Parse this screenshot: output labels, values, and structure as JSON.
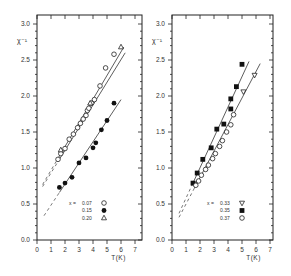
{
  "chart_data": [
    {
      "type": "scatter",
      "panel": "left",
      "title": "",
      "xlabel": "T(K)",
      "ylabel": "χ⁻¹",
      "xlim": [
        0,
        7.5
      ],
      "ylim": [
        0,
        3.0
      ],
      "xticks": [
        0,
        1,
        2,
        3,
        4,
        5,
        6,
        7
      ],
      "xtick_labels": [
        "0",
        "1",
        "2",
        "3",
        "4",
        "5",
        "6",
        "7"
      ],
      "yticks": [
        0.0,
        0.5,
        1.0,
        1.5,
        2.0,
        2.5,
        3.0
      ],
      "ytick_labels": [
        "0.0",
        "0.5",
        "1.0",
        "1.5",
        "2.0",
        "2.5",
        "3.0"
      ],
      "legend_position": "bottom-right",
      "legend_prefix": "x =",
      "series": [
        {
          "name": "0.07",
          "marker": "open-circle",
          "x": [
            1.5,
            1.7,
            2.0,
            2.3,
            2.6,
            2.9,
            3.1,
            3.3,
            3.5,
            3.6,
            3.7,
            3.9,
            4.1,
            4.5,
            4.9,
            5.5
          ],
          "y": [
            1.12,
            1.2,
            1.27,
            1.4,
            1.47,
            1.56,
            1.62,
            1.68,
            1.73,
            1.8,
            1.83,
            1.9,
            1.95,
            2.14,
            2.39,
            2.58
          ]
        },
        {
          "name": "0.15",
          "marker": "filled-circle",
          "x": [
            1.6,
            2.0,
            2.5,
            3.0,
            3.5,
            4.0,
            4.2,
            4.6,
            5.0,
            5.5
          ],
          "y": [
            0.73,
            0.79,
            0.87,
            1.07,
            1.14,
            1.28,
            1.35,
            1.53,
            1.66,
            1.9
          ]
        },
        {
          "name": "0.20",
          "marker": "open-triangle",
          "x": [
            1.7,
            3.8,
            6.0
          ],
          "y": [
            1.25,
            1.9,
            2.68
          ]
        }
      ],
      "fit_lines": [
        {
          "name": "fit-0.07",
          "x": [
            1.4,
            6.2
          ],
          "y": [
            1.1,
            2.68
          ],
          "extrapolated_x": [
            0.4,
            1.4
          ]
        },
        {
          "name": "fit-0.20",
          "x": [
            1.6,
            6.3
          ],
          "y": [
            1.12,
            2.6
          ],
          "extrapolated_x": [
            0.4,
            1.6
          ]
        },
        {
          "name": "fit-0.15",
          "x": [
            1.6,
            6.0
          ],
          "y": [
            0.66,
            1.95
          ],
          "extrapolated_x": [
            0.5,
            1.6
          ]
        }
      ]
    },
    {
      "type": "scatter",
      "panel": "right",
      "title": "",
      "xlabel": "T(K)",
      "ylabel": "χ⁻¹",
      "xlim": [
        0,
        7.5
      ],
      "ylim": [
        0,
        3.0
      ],
      "xticks": [
        0,
        1,
        2,
        3,
        4,
        5,
        6,
        7
      ],
      "xtick_labels": [
        "0",
        "1",
        "2",
        "3",
        "4",
        "5",
        "6",
        "7"
      ],
      "yticks": [
        0.0,
        0.5,
        1.0,
        1.5,
        2.0,
        2.5,
        3.0
      ],
      "ytick_labels": [
        "0.0",
        "0.5",
        "1.0",
        "1.5",
        "2.0",
        "2.5",
        "3.0"
      ],
      "legend_position": "bottom-right",
      "legend_prefix": "x =",
      "series": [
        {
          "name": "0.33",
          "marker": "open-triangle-down",
          "x": [
            1.6,
            5.1,
            5.9
          ],
          "y": [
            0.78,
            2.06,
            2.29
          ]
        },
        {
          "name": "0.35",
          "marker": "filled-square",
          "x": [
            1.5,
            1.8,
            2.2,
            2.8,
            3.2,
            3.7,
            4.2,
            4.2,
            4.6,
            5.0
          ],
          "y": [
            0.79,
            0.93,
            1.12,
            1.28,
            1.54,
            1.61,
            1.82,
            1.96,
            2.13,
            2.44
          ]
        },
        {
          "name": "0.37",
          "marker": "open-circle",
          "x": [
            1.7,
            1.9,
            2.1,
            2.4,
            2.6,
            2.9,
            3.1,
            3.4,
            3.6,
            3.9,
            4.2,
            4.4
          ],
          "y": [
            0.76,
            0.82,
            0.9,
            0.98,
            1.04,
            1.13,
            1.2,
            1.3,
            1.38,
            1.5,
            1.6,
            1.74
          ]
        }
      ],
      "fit_lines": [
        {
          "name": "fit-0.35",
          "x": [
            1.4,
            5.5
          ],
          "y": [
            0.75,
            2.48
          ],
          "extrapolated_x": [
            0.5,
            1.4
          ]
        },
        {
          "name": "fit-0.33",
          "x": [
            1.6,
            6.3
          ],
          "y": [
            0.72,
            2.45
          ],
          "extrapolated_x": [
            0.5,
            1.6
          ]
        }
      ]
    }
  ]
}
